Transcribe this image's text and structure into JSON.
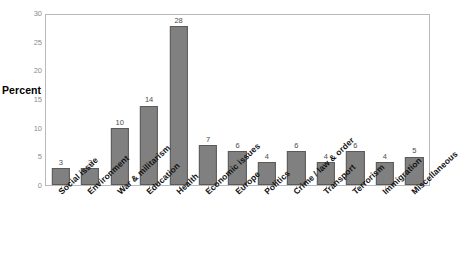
{
  "chart_data": {
    "type": "bar",
    "title": "",
    "xlabel": "",
    "ylabel": "Percent",
    "ylim": [
      0,
      30
    ],
    "yticks": [
      0,
      5,
      10,
      15,
      20,
      25,
      30
    ],
    "grid": false,
    "legend": "none",
    "bar_color": "#808080",
    "bar_border_color": "#5a5a5a",
    "plot_border_color": "#b9b9b9",
    "tick_label_color": "#8c8c8c",
    "value_label_color": "#4d4d4d",
    "category_label_rotation": -43,
    "categories": [
      "Social issue",
      "Environment",
      "War & militarism",
      "Education",
      "Health",
      "Economic issues",
      "Europe",
      "Politics",
      "Crime / law & order",
      "Transport",
      "Terrorism",
      "Immigration",
      "Miscellaneous"
    ],
    "values": [
      3,
      3,
      10,
      14,
      28,
      7,
      6,
      4,
      6,
      4,
      6,
      4,
      5
    ],
    "value_labels": [
      "3",
      "3",
      "10",
      "14",
      "28",
      "7",
      "6",
      "4",
      "6",
      "4",
      "6",
      "4",
      "5"
    ],
    "ytick_labels": [
      "0",
      "5",
      "10",
      "15",
      "20",
      "25",
      "30"
    ]
  }
}
